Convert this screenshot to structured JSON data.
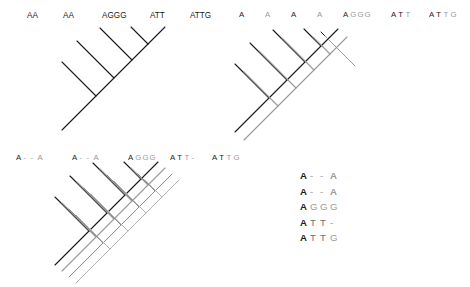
{
  "figure": {
    "type": "phylogenetic-tree-character-mapping",
    "background": "#ffffff",
    "colors": {
      "black": "#1a1a1a",
      "gray": "#9a9a9a",
      "gray_light": "#b4b4b4",
      "gray_mid": "#8c8c8c"
    }
  },
  "panel_a": {
    "name": "single-tree-with-sequences",
    "tips": [
      {
        "label": "AA",
        "color": "#1a1a1a"
      },
      {
        "label": "AA",
        "color": "#1a1a1a"
      },
      {
        "label": "AGGG",
        "color": "#1a1a1a"
      },
      {
        "label": "ATT",
        "color": "#1a1a1a"
      },
      {
        "label": "ATTG",
        "color": "#1a1a1a"
      }
    ],
    "topology": "(((( AA , AA ) , AGGG ) , ( ATT , ATTG )))",
    "style": "ladderized-cladogram"
  },
  "panel_b": {
    "name": "two-overlaid-character-trees",
    "n_overlays": 2,
    "overlay_colors": [
      "#1a1a1a",
      "#9a9a9a"
    ],
    "tip_groups": [
      {
        "chars": [
          {
            "t": "A",
            "c": "#1a1a1a"
          }
        ]
      },
      {
        "chars": [
          {
            "t": "A",
            "c": "#9a9a9a"
          }
        ]
      },
      {
        "chars": [
          {
            "t": "A",
            "c": "#1a1a1a"
          }
        ]
      },
      {
        "chars": [
          {
            "t": "A",
            "c": "#9a9a9a"
          }
        ]
      },
      {
        "chars": [
          {
            "t": "A",
            "c": "#1a1a1a"
          },
          {
            "t": "G",
            "c": "#9a9a9a"
          },
          {
            "t": "G",
            "c": "#9a9a9a"
          },
          {
            "t": "G",
            "c": "#9a9a9a"
          }
        ]
      },
      {
        "chars": [
          {
            "t": "A",
            "c": "#1a1a1a"
          },
          {
            "t": "T",
            "c": "#1a1a1a"
          },
          {
            "t": "T",
            "c": "#9a9a9a"
          }
        ]
      },
      {
        "chars": [
          {
            "t": "A",
            "c": "#1a1a1a"
          },
          {
            "t": "T",
            "c": "#1a1a1a"
          },
          {
            "t": "T",
            "c": "#9a9a9a"
          },
          {
            "t": "G",
            "c": "#9a9a9a"
          }
        ]
      }
    ],
    "tip_labels": [
      "A",
      "A",
      "A",
      "A",
      "AGGG",
      "ATT",
      "ATTG"
    ]
  },
  "panel_c": {
    "name": "four-overlaid-character-trees",
    "n_overlays": 4,
    "overlay_colors": [
      "#1a1a1a",
      "#9a9a9a",
      "#8c8c8c",
      "#b4b4b4"
    ],
    "tip_groups": [
      {
        "chars": [
          {
            "t": "A",
            "c": "#1a1a1a"
          },
          {
            "t": "-",
            "c": "#9a9a9a"
          },
          {
            "t": "-",
            "c": "#9a9a9a"
          },
          {
            "t": "A",
            "c": "#9a9a9a"
          }
        ]
      },
      {
        "chars": [
          {
            "t": "A",
            "c": "#1a1a1a"
          },
          {
            "t": "-",
            "c": "#9a9a9a"
          },
          {
            "t": "-",
            "c": "#9a9a9a"
          },
          {
            "t": "A",
            "c": "#9a9a9a"
          }
        ]
      },
      {
        "chars": [
          {
            "t": "A",
            "c": "#1a1a1a"
          },
          {
            "t": "G",
            "c": "#9a9a9a"
          },
          {
            "t": "G",
            "c": "#9a9a9a"
          },
          {
            "t": "G",
            "c": "#9a9a9a"
          }
        ]
      },
      {
        "chars": [
          {
            "t": "A",
            "c": "#1a1a1a"
          },
          {
            "t": "T",
            "c": "#1a1a1a"
          },
          {
            "t": "T",
            "c": "#9a9a9a"
          },
          {
            "t": "-",
            "c": "#9a9a9a"
          }
        ]
      },
      {
        "chars": [
          {
            "t": "A",
            "c": "#1a1a1a"
          },
          {
            "t": "T",
            "c": "#1a1a1a"
          },
          {
            "t": "T",
            "c": "#9a9a9a"
          },
          {
            "t": "G",
            "c": "#9a9a9a"
          }
        ]
      }
    ],
    "tip_labels": [
      "A--A",
      "A--A",
      "AGGG",
      "ATT-",
      "ATTG"
    ]
  },
  "panel_d": {
    "name": "sequence-alignment-block",
    "rows": [
      {
        "id": "row1",
        "chars": [
          {
            "t": "A",
            "c": "#1a1a1a"
          },
          {
            "t": "-",
            "c": "#9a9a9a"
          },
          {
            "t": "-",
            "c": "#9a9a9a"
          },
          {
            "t": "A",
            "c": "#9a9a9a"
          }
        ]
      },
      {
        "id": "row2",
        "chars": [
          {
            "t": "A",
            "c": "#1a1a1a"
          },
          {
            "t": "-",
            "c": "#9a9a9a"
          },
          {
            "t": "-",
            "c": "#9a9a9a"
          },
          {
            "t": "A",
            "c": "#9a9a9a"
          }
        ]
      },
      {
        "id": "row3",
        "chars": [
          {
            "t": "A",
            "c": "#1a1a1a"
          },
          {
            "t": "G",
            "c": "#9a9a9a"
          },
          {
            "t": "G",
            "c": "#9a9a9a"
          },
          {
            "t": "G",
            "c": "#9a9a9a"
          }
        ]
      },
      {
        "id": "row4",
        "chars": [
          {
            "t": "A",
            "c": "#1a1a1a"
          },
          {
            "t": "T",
            "c": "#6e6e6e"
          },
          {
            "t": "T",
            "c": "#6e6e6e"
          },
          {
            "t": "-",
            "c": "#9a9a9a"
          }
        ]
      },
      {
        "id": "row5",
        "chars": [
          {
            "t": "A",
            "c": "#1a1a1a"
          },
          {
            "t": "T",
            "c": "#6e6e6e"
          },
          {
            "t": "T",
            "c": "#6e6e6e"
          },
          {
            "t": "G",
            "c": "#9a9a9a"
          }
        ]
      }
    ],
    "plain_rows": [
      "A - - A",
      "A - - A",
      "A G G G",
      "A T T -",
      "A T T G"
    ]
  }
}
